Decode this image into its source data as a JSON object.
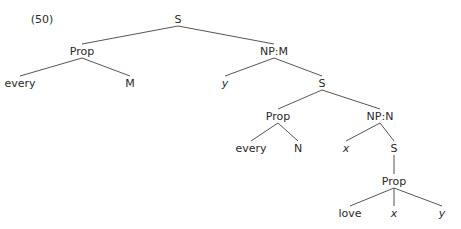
{
  "example_number": "(50)",
  "nodes": [
    {
      "id": "s1",
      "label": "S",
      "x": 178,
      "y": 19,
      "italic": false
    },
    {
      "id": "prop1",
      "label": "Prop",
      "x": 82,
      "y": 51,
      "italic": false
    },
    {
      "id": "every1",
      "label": "every",
      "x": 20,
      "y": 83,
      "italic": false
    },
    {
      "id": "m1",
      "label": "M",
      "x": 130,
      "y": 83,
      "italic": false
    },
    {
      "id": "npm",
      "label": "NP:M",
      "x": 274,
      "y": 51,
      "italic": false
    },
    {
      "id": "y1",
      "label": "y",
      "x": 225,
      "y": 83,
      "italic": true
    },
    {
      "id": "s2",
      "label": "S",
      "x": 322,
      "y": 83,
      "italic": false
    },
    {
      "id": "prop2",
      "label": "Prop",
      "x": 278,
      "y": 116,
      "italic": false
    },
    {
      "id": "every2",
      "label": "every",
      "x": 251,
      "y": 148,
      "italic": false
    },
    {
      "id": "n1",
      "label": "N",
      "x": 298,
      "y": 148,
      "italic": false
    },
    {
      "id": "npn",
      "label": "NP:N",
      "x": 380,
      "y": 116,
      "italic": false
    },
    {
      "id": "x1",
      "label": "x",
      "x": 346,
      "y": 148,
      "italic": true
    },
    {
      "id": "s3",
      "label": "S",
      "x": 394,
      "y": 148,
      "italic": false
    },
    {
      "id": "prop3",
      "label": "Prop",
      "x": 394,
      "y": 181,
      "italic": false
    },
    {
      "id": "love",
      "label": "love",
      "x": 350,
      "y": 213,
      "italic": false
    },
    {
      "id": "x2",
      "label": "x",
      "x": 394,
      "y": 213,
      "italic": true
    },
    {
      "id": "y2",
      "label": "y",
      "x": 442,
      "y": 213,
      "italic": true
    }
  ],
  "edges": [
    [
      "s1",
      "prop1"
    ],
    [
      "s1",
      "npm"
    ],
    [
      "prop1",
      "every1"
    ],
    [
      "prop1",
      "m1"
    ],
    [
      "npm",
      "y1"
    ],
    [
      "npm",
      "s2"
    ],
    [
      "s2",
      "prop2"
    ],
    [
      "s2",
      "npn"
    ],
    [
      "prop2",
      "every2"
    ],
    [
      "prop2",
      "n1"
    ],
    [
      "npn",
      "x1"
    ],
    [
      "npn",
      "s3"
    ],
    [
      "s3",
      "prop3"
    ],
    [
      "prop3",
      "love"
    ],
    [
      "prop3",
      "x2"
    ],
    [
      "prop3",
      "y2"
    ]
  ]
}
